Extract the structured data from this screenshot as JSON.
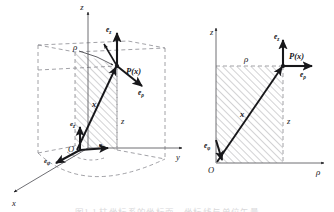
{
  "figure": {
    "background_color": "#ffffff",
    "ink_color": "#17171a",
    "dash_color": "#8a8a90",
    "hatch_color": "#8e8e94",
    "panels": [
      {
        "id": "left",
        "name": "three-dimensional-view",
        "description": "Perspective view of cylindrical coordinates with cylinder outline"
      },
      {
        "id": "right",
        "name": "meridian-plane-view",
        "description": "Meridian half-plane view in rho-z coordinates"
      }
    ],
    "caption": "图1-1 柱坐标系的坐标面、坐标线与单位矢量"
  },
  "left_panel": {
    "axes": [
      {
        "name": "x-axis",
        "label": "x"
      },
      {
        "name": "y-axis",
        "label": "y"
      },
      {
        "name": "z-axis",
        "label": "z"
      }
    ],
    "origin_label": "O",
    "point_label": "P(x)",
    "position_vector_label": "x",
    "radial_coordinate_label": "ρ",
    "height_coordinate_label": "z",
    "basis_vectors": [
      {
        "name": "e-rho-at-point",
        "base": "e",
        "subscript": "ρ"
      },
      {
        "name": "e-z-at-point",
        "base": "e",
        "subscript": "z"
      },
      {
        "name": "e-rho-at-origin",
        "base": "e",
        "subscript": "ρ"
      },
      {
        "name": "e-phi-at-origin",
        "base": "e",
        "subscript": "φ"
      },
      {
        "name": "e-z-at-origin",
        "base": "e",
        "subscript": "z"
      }
    ]
  },
  "right_panel": {
    "axes": [
      {
        "name": "rho-axis",
        "label": "ρ"
      },
      {
        "name": "z-axis",
        "label": "z"
      }
    ],
    "origin_label": "O",
    "point_label": "P(x)",
    "position_vector_label": "x",
    "radial_coordinate_label": "ρ",
    "height_coordinate_label": "z",
    "basis_vectors": [
      {
        "name": "e-rho-at-point",
        "base": "e",
        "subscript": "ρ"
      },
      {
        "name": "e-z-at-point",
        "base": "e",
        "subscript": "z"
      },
      {
        "name": "e-phi-at-origin",
        "base": "e",
        "subscript": "φ"
      }
    ]
  }
}
